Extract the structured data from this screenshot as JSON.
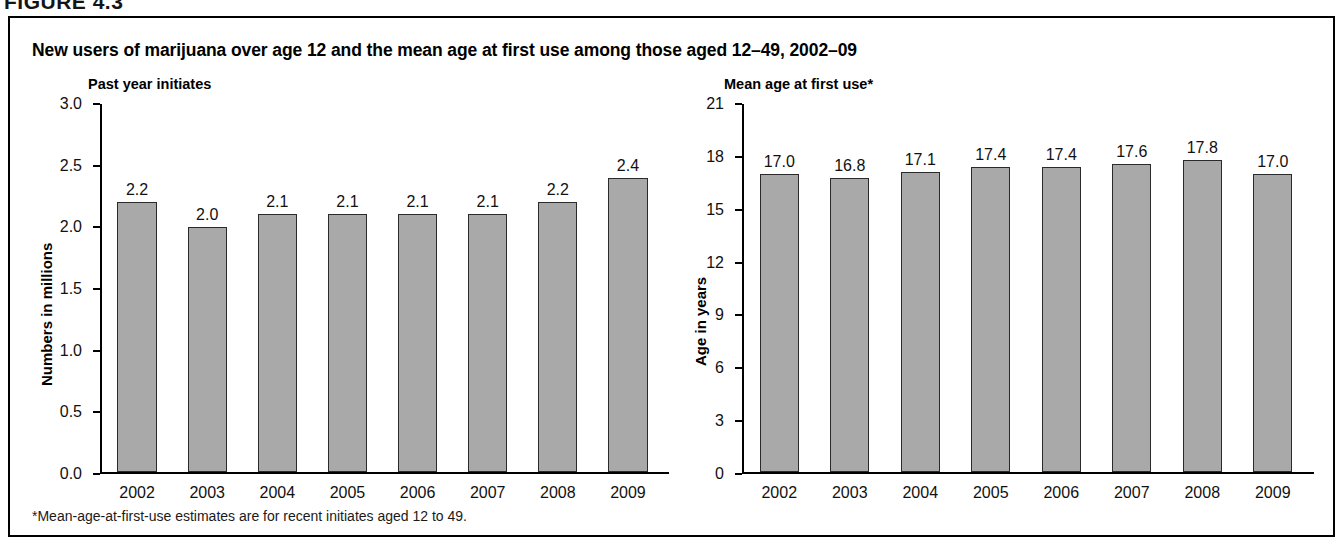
{
  "figure": {
    "header": "FIGURE 4.3",
    "title": "New users of marijuana over age 12 and the mean age at first use among those aged 12–49, 2002–09",
    "footnote": "*Mean-age-at-first-use estimates are for recent initiates aged 12 to 49.",
    "bar_color": "#a9a9a9",
    "bar_border_color": "#2a2a2a",
    "frame_color": "#000000"
  },
  "chart_data": [
    {
      "type": "bar",
      "title": "Past year initiates",
      "xlabel": "",
      "ylabel": "Numbers in millions",
      "categories": [
        "2002",
        "2003",
        "2004",
        "2005",
        "2006",
        "2007",
        "2008",
        "2009"
      ],
      "values": [
        2.2,
        2.0,
        2.1,
        2.1,
        2.1,
        2.1,
        2.2,
        2.4
      ],
      "value_labels": [
        "2.2",
        "2.0",
        "2.1",
        "2.1",
        "2.1",
        "2.1",
        "2.2",
        "2.4"
      ],
      "ylim": [
        0.0,
        3.0
      ],
      "yticks": [
        3.0,
        2.5,
        2.0,
        1.5,
        1.0,
        0.5,
        0.0
      ],
      "ytick_labels": [
        "3.0",
        "2.5",
        "2.0",
        "1.5",
        "1.0",
        "0.5",
        "0.0"
      ],
      "grid": false,
      "legend": "none"
    },
    {
      "type": "bar",
      "title": "Mean age at first use*",
      "xlabel": "",
      "ylabel": "Age in years",
      "categories": [
        "2002",
        "2003",
        "2004",
        "2005",
        "2006",
        "2007",
        "2008",
        "2009"
      ],
      "values": [
        17.0,
        16.8,
        17.1,
        17.4,
        17.4,
        17.6,
        17.8,
        17.0
      ],
      "value_labels": [
        "17.0",
        "16.8",
        "17.1",
        "17.4",
        "17.4",
        "17.6",
        "17.8",
        "17.0"
      ],
      "ylim": [
        0,
        21
      ],
      "yticks": [
        21,
        18,
        15,
        12,
        9,
        6,
        3,
        0
      ],
      "ytick_labels": [
        "21",
        "18",
        "15",
        "12",
        "9",
        "6",
        "3",
        "0"
      ],
      "grid": false,
      "legend": "none"
    }
  ]
}
